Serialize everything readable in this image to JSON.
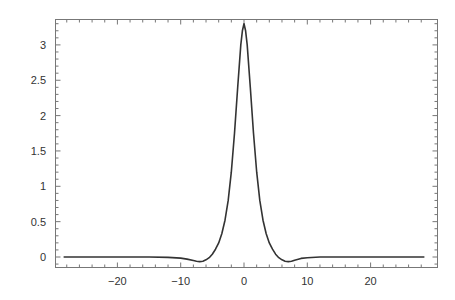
{
  "chart_data": {
    "type": "line",
    "title": "",
    "xlabel": "",
    "ylabel": "",
    "xlim": [
      -29.5,
      30
    ],
    "ylim": [
      -0.15,
      3.35
    ],
    "grid": false,
    "legend": null,
    "frame": true,
    "x_ticks": [
      -20,
      -10,
      0,
      10,
      20
    ],
    "x_tick_labels": [
      "−20",
      "−10",
      "0",
      "10",
      "20"
    ],
    "y_ticks": [
      0,
      0.5,
      1,
      1.5,
      2,
      2.5,
      3
    ],
    "y_tick_labels": [
      "0",
      "0.5",
      "1",
      "1.5",
      "2",
      "2.5",
      "3"
    ],
    "series": [
      {
        "name": "curve",
        "color": "#333333",
        "x": [
          -28.5,
          -20,
          -15,
          -12,
          -10,
          -9,
          -8,
          -7.5,
          -7,
          -6.5,
          -6,
          -5.5,
          -5,
          -4.5,
          -4,
          -3.5,
          -3,
          -2.5,
          -2,
          -1.5,
          -1,
          -0.5,
          -0.25,
          0,
          0.25,
          0.5,
          1,
          1.5,
          2,
          2.5,
          3,
          3.5,
          4,
          4.5,
          5,
          5.5,
          6,
          6.5,
          7,
          7.5,
          8,
          9,
          10,
          12,
          15,
          20,
          28.5
        ],
        "values": [
          0,
          0,
          0,
          -0.005,
          -0.015,
          -0.03,
          -0.05,
          -0.06,
          -0.065,
          -0.06,
          -0.04,
          -0.01,
          0.04,
          0.11,
          0.2,
          0.33,
          0.52,
          0.8,
          1.2,
          1.75,
          2.4,
          3.0,
          3.2,
          3.3,
          3.2,
          3.0,
          2.4,
          1.75,
          1.2,
          0.8,
          0.52,
          0.33,
          0.2,
          0.11,
          0.04,
          -0.01,
          -0.04,
          -0.06,
          -0.065,
          -0.06,
          -0.045,
          -0.02,
          -0.01,
          0,
          0,
          0,
          0
        ]
      }
    ]
  }
}
